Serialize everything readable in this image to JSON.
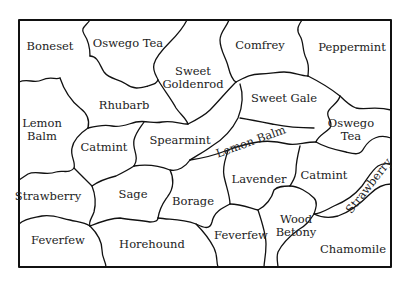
{
  "diagram": {
    "type": "garden-plot-map",
    "colors": {
      "background": "#ffffff",
      "border": "#111111",
      "text": "#222222"
    },
    "plots": [
      {
        "id": "boneset",
        "lines": [
          "Boneset"
        ],
        "x": 50,
        "y": 46,
        "rotate": 0
      },
      {
        "id": "oswego-tea-top",
        "lines": [
          "Oswego Tea"
        ],
        "x": 128,
        "y": 43,
        "rotate": 0
      },
      {
        "id": "sweet-goldenrod",
        "lines": [
          "Sweet",
          "Goldenrod"
        ],
        "x": 193,
        "y": 78,
        "rotate": 0
      },
      {
        "id": "comfrey",
        "lines": [
          "Comfrey"
        ],
        "x": 260,
        "y": 45,
        "rotate": 0
      },
      {
        "id": "peppermint",
        "lines": [
          "Peppermint"
        ],
        "x": 352,
        "y": 47,
        "rotate": 0
      },
      {
        "id": "rhubarb",
        "lines": [
          "Rhubarb"
        ],
        "x": 124,
        "y": 105,
        "rotate": 0
      },
      {
        "id": "sweet-gale",
        "lines": [
          "Sweet Gale"
        ],
        "x": 284,
        "y": 98,
        "rotate": 0
      },
      {
        "id": "lemon-balm-left",
        "lines": [
          "Lemon",
          "Balm"
        ],
        "x": 42,
        "y": 130,
        "rotate": 0
      },
      {
        "id": "oswego-tea-right",
        "lines": [
          "Oswego",
          "Tea"
        ],
        "x": 351,
        "y": 130,
        "rotate": 0
      },
      {
        "id": "catmint-left",
        "lines": [
          "Catmint"
        ],
        "x": 104,
        "y": 147,
        "rotate": 0
      },
      {
        "id": "spearmint",
        "lines": [
          "Spearmint"
        ],
        "x": 180,
        "y": 140,
        "rotate": 0
      },
      {
        "id": "lemon-balm-center",
        "lines": [
          "Lemon Balm"
        ],
        "x": 251,
        "y": 142,
        "rotate": -20
      },
      {
        "id": "strawberry-left",
        "lines": [
          "Strawberry"
        ],
        "x": 48,
        "y": 196,
        "rotate": 0
      },
      {
        "id": "sage",
        "lines": [
          "Sage"
        ],
        "x": 133,
        "y": 194,
        "rotate": 0
      },
      {
        "id": "borage",
        "lines": [
          "Borage"
        ],
        "x": 193,
        "y": 201,
        "rotate": 0
      },
      {
        "id": "lavender",
        "lines": [
          "Lavender"
        ],
        "x": 259,
        "y": 179,
        "rotate": 0
      },
      {
        "id": "catmint-right",
        "lines": [
          "Catmint"
        ],
        "x": 324,
        "y": 175,
        "rotate": 0
      },
      {
        "id": "strawberry-right",
        "lines": [
          "Strawberry"
        ],
        "x": 369,
        "y": 186,
        "rotate": -52
      },
      {
        "id": "wood-betony",
        "lines": [
          "Wood",
          "Betony"
        ],
        "x": 296,
        "y": 226,
        "rotate": 0
      },
      {
        "id": "feverfew-left",
        "lines": [
          "Feverfew"
        ],
        "x": 58,
        "y": 240,
        "rotate": 0
      },
      {
        "id": "horehound",
        "lines": [
          "Horehound"
        ],
        "x": 152,
        "y": 244,
        "rotate": 0
      },
      {
        "id": "feverfew-right",
        "lines": [
          "Feverfew"
        ],
        "x": 241,
        "y": 235,
        "rotate": 0
      },
      {
        "id": "chamomile",
        "lines": [
          "Chamomile"
        ],
        "x": 353,
        "y": 249,
        "rotate": 0
      }
    ]
  }
}
